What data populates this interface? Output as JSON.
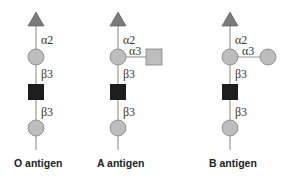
{
  "diagram": {
    "colors": {
      "fucose": "#7a7a7a",
      "galactose": "#bdbdbd",
      "glcnac": "#1e1e1e",
      "galnac": "#bdbdbd",
      "line": "#9a9a9a"
    },
    "columns": [
      {
        "title": "O antigen",
        "links": [
          "α2",
          "β3",
          "β3"
        ],
        "branch": null
      },
      {
        "title": "A antigen",
        "links": [
          "α2",
          "β3",
          "β3"
        ],
        "branch": {
          "link": "α3",
          "shape": "square"
        }
      },
      {
        "title": "B antigen",
        "links": [
          "α2",
          "β3",
          "β3"
        ],
        "branch": {
          "link": "α3",
          "shape": "circle"
        }
      }
    ]
  }
}
